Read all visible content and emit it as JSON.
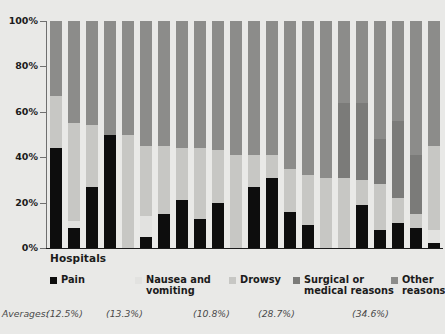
{
  "chart_data": {
    "type": "bar",
    "subtype": "100% stacked bar",
    "title": "",
    "xlabel": "Hospitals",
    "ylabel": "",
    "ylim": [
      0,
      100
    ],
    "ytick_labels": [
      "0%",
      "20%",
      "40%",
      "60%",
      "80%",
      "100%"
    ],
    "ytick_values": [
      0,
      20,
      40,
      60,
      80,
      100
    ],
    "grid": false,
    "legend_position": "bottom",
    "categories": [
      "Hospital 1",
      "Hospital 2",
      "Hospital 3",
      "Hospital 4",
      "Hospital 5",
      "Hospital 6",
      "Hospital 7",
      "Hospital 8",
      "Hospital 9",
      "Hospital 10",
      "Hospital 11",
      "Hospital 12",
      "Hospital 13",
      "Hospital 14",
      "Hospital 15",
      "Hospital 16",
      "Hospital 17",
      "Hospital 18",
      "Hospital 19",
      "Hospital 20",
      "Hospital 21",
      "Hospital 22"
    ],
    "series": [
      {
        "name": "Pain",
        "color": "#0d0d0d",
        "average": 12.5,
        "average_label": "(12.5%)",
        "values": [
          44,
          9,
          27,
          50,
          0,
          5,
          15,
          21,
          13,
          20,
          0,
          27,
          31,
          16,
          10,
          0,
          0,
          19,
          8,
          11,
          9,
          2
        ]
      },
      {
        "name": "Nausea and vomiting",
        "color": "#e2e2e0",
        "average": 13.3,
        "average_label": "(13.3%)",
        "values": [
          0,
          3,
          0,
          0,
          0,
          9,
          0,
          0,
          0,
          0,
          0,
          0,
          0,
          0,
          0,
          0,
          0,
          0,
          0,
          0,
          0,
          6
        ]
      },
      {
        "name": "Drowsy",
        "color": "#c7c7c4",
        "average": 10.8,
        "average_label": "(10.8%)",
        "values": [
          23,
          43,
          27,
          0,
          50,
          31,
          30,
          23,
          31,
          23,
          41,
          14,
          10,
          19,
          22,
          31,
          31,
          11,
          20,
          11,
          6,
          37
        ]
      },
      {
        "name": "Surgical or medical reasons",
        "color": "#7b7b79",
        "average": 28.7,
        "average_label": "(28.7%)",
        "values": [
          0,
          0,
          0,
          0,
          0,
          0,
          0,
          0,
          0,
          0,
          0,
          0,
          0,
          0,
          0,
          0,
          33,
          34,
          20,
          34,
          26,
          0
        ]
      },
      {
        "name": "Other reasons",
        "color": "#8c8c8a",
        "average": 34.6,
        "average_label": "(34.6%)",
        "values": [
          33,
          45,
          46,
          50,
          50,
          55,
          55,
          56,
          56,
          57,
          59,
          59,
          59,
          65,
          68,
          69,
          36,
          36,
          52,
          44,
          59,
          55
        ]
      }
    ],
    "bar_stacks": [
      [
        44,
        0,
        23,
        0,
        33
      ],
      [
        9,
        3,
        43,
        0,
        45
      ],
      [
        27,
        0,
        27,
        0,
        46
      ],
      [
        50,
        0,
        0,
        0,
        50
      ],
      [
        0,
        0,
        50,
        0,
        50
      ],
      [
        5,
        9,
        31,
        0,
        55
      ],
      [
        15,
        0,
        30,
        0,
        55
      ],
      [
        21,
        0,
        23,
        0,
        56
      ],
      [
        13,
        0,
        31,
        0,
        56
      ],
      [
        20,
        0,
        23,
        0,
        57
      ],
      [
        0,
        0,
        41,
        0,
        59
      ],
      [
        27,
        0,
        14,
        0,
        59
      ],
      [
        31,
        0,
        10,
        0,
        59
      ],
      [
        16,
        0,
        19,
        0,
        65
      ],
      [
        10,
        0,
        22,
        0,
        68
      ],
      [
        0,
        0,
        31,
        0,
        69
      ],
      [
        0,
        0,
        31,
        33,
        36
      ],
      [
        19,
        0,
        11,
        34,
        36
      ],
      [
        8,
        0,
        20,
        20,
        52
      ],
      [
        11,
        0,
        11,
        34,
        44
      ],
      [
        9,
        0,
        6,
        26,
        59
      ],
      [
        2,
        6,
        37,
        0,
        55
      ]
    ]
  },
  "axis": {
    "x_title": "Hospitals",
    "ticks": [
      {
        "label": "100%",
        "value": 100
      },
      {
        "label": "80%",
        "value": 80
      },
      {
        "label": "60%",
        "value": 60
      },
      {
        "label": "40%",
        "value": 40
      },
      {
        "label": "20%",
        "value": 20
      },
      {
        "label": "0%",
        "value": 0
      }
    ]
  },
  "legend": {
    "items": [
      {
        "label": "Pain",
        "color": "#0d0d0d",
        "left": 3
      },
      {
        "label": "Nausea and\nvomiting",
        "color": "#e2e2e0",
        "left": 88
      },
      {
        "label": "Drowsy",
        "color": "#c7c7c4",
        "left": 182
      },
      {
        "label": "Surgical or\nmedical reasons",
        "color": "#7b7b79",
        "left": 246
      },
      {
        "label": "Other reasons",
        "color": "#8c8c8a",
        "left": 344
      }
    ]
  },
  "averages": {
    "caption": "Averages:",
    "cells": [
      {
        "label": "(12.5%)",
        "left": 46
      },
      {
        "label": "(13.3%)",
        "left": 106
      },
      {
        "label": "(10.8%)",
        "left": 193
      },
      {
        "label": "(28.7%)",
        "left": 258
      },
      {
        "label": "(34.6%)",
        "left": 352
      }
    ]
  },
  "colors": {
    "background": "#e9e9e7",
    "axis": "#1b1b1b",
    "text": "#1b1b1b",
    "muted_text": "#4a4a4a"
  }
}
